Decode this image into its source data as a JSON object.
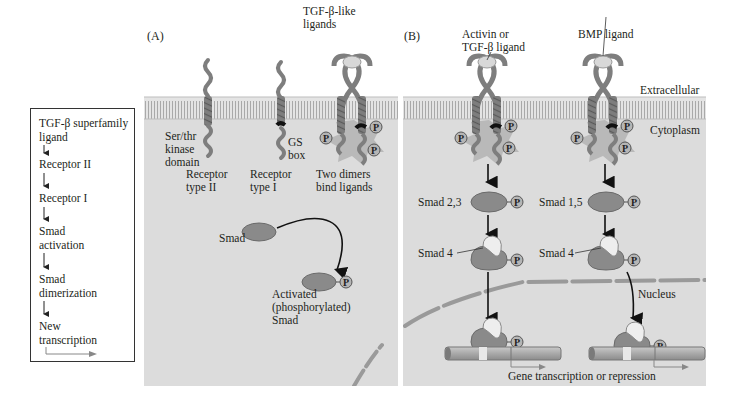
{
  "flowchart": {
    "steps": [
      {
        "line1": "TGF-β superfamily",
        "line2": "ligand"
      },
      {
        "line1": "Receptor II"
      },
      {
        "line1": "Receptor I"
      },
      {
        "line1": "Smad",
        "line2": "activation"
      },
      {
        "line1": "Smad",
        "line2": "dimerization"
      },
      {
        "line1": "New",
        "line2": "transcription"
      }
    ]
  },
  "panel_a": {
    "label": "(A)",
    "ligand_label": {
      "line1": "TGF-β-like",
      "line2": "ligands"
    },
    "kinase_label": {
      "line1": "Ser/thr",
      "line2": "kinase",
      "line3": "domain"
    },
    "gs_label": {
      "line1": "GS",
      "line2": "box"
    },
    "receptor2": {
      "line1": "Receptor",
      "line2": "type II"
    },
    "receptor1": {
      "line1": "Receptor",
      "line2": "type I"
    },
    "dimers": {
      "line1": "Two dimers",
      "line2": "bind ligands"
    },
    "smad": "Smad",
    "activated": {
      "line1": "Activated",
      "line2": "(phosphorylated)",
      "line3": "Smad"
    },
    "phospho": "P"
  },
  "panel_b": {
    "label": "(B)",
    "activin_label": {
      "line1": "Activin or",
      "line2": "TGF-β ligand"
    },
    "bmp_label": "BMP ligand",
    "extracellular": "Extracellular",
    "cytoplasm": "Cytoplasm",
    "smad23": "Smad 2,3",
    "smad15": "Smad 1,5",
    "smad4_left": "Smad 4",
    "smad4_right": "Smad 4",
    "nucleus": "Nucleus",
    "gene": "Gene transcription or repression",
    "phospho": "P"
  },
  "colors": {
    "cytoplasm": "#dcdcdc",
    "membrane": "#c8c8c8",
    "smad": "#8a8a8a",
    "smad_light": "#eeeeee",
    "phospho_fill": "#b5b5b5",
    "receptor": "#7d7d7d",
    "kinase_star": "#b8b8b8",
    "dna": "#a8a8a8"
  }
}
